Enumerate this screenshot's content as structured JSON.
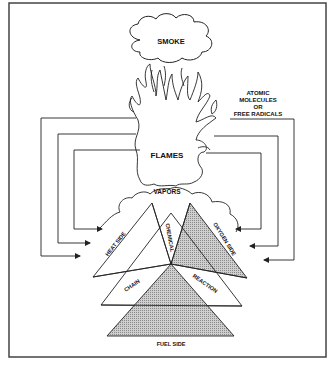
{
  "diagram": {
    "labels": {
      "smoke": "SMOKE",
      "flames": "FLAMES",
      "vapors": "VAPORS",
      "radicals_line1": "ATOMIC",
      "radicals_line2": "MOLECULES",
      "radicals_line3": "OR",
      "radicals_line4": "FREE RADICALS",
      "heat_side": "HEAT SIDE",
      "chemical": "CHEMICAL",
      "oxygen_side": "OXYGEN SIDE",
      "chain": "CHAIN",
      "reaction": "REACTION",
      "fuel_side": "FUEL SIDE"
    },
    "colors": {
      "line": "#222222",
      "shade": "#b8b8b8",
      "background": "#ffffff",
      "border": "#444444"
    },
    "feedback_arrows": {
      "left_count": 3,
      "right_count": 3
    }
  }
}
